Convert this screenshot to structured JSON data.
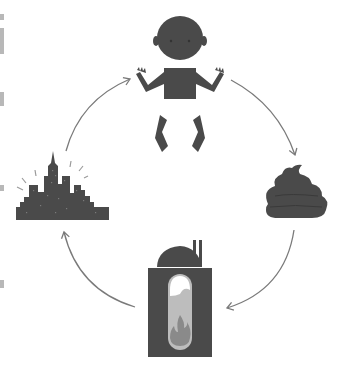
{
  "diagram": {
    "type": "cycle",
    "title": "",
    "colors": {
      "background": "#ffffff",
      "figure": "#4a4a4a",
      "arrow": "#7a7a7a",
      "flame": "#8a8a8a",
      "chamber_light": "#bdbdbd",
      "chamber_top": "#ffffff"
    },
    "nodes": [
      {
        "id": "baby",
        "icon": "baby-icon",
        "position": "top"
      },
      {
        "id": "poop",
        "icon": "poop-icon",
        "position": "right"
      },
      {
        "id": "incinerator",
        "icon": "incinerator-icon",
        "position": "bottom"
      },
      {
        "id": "city",
        "icon": "city-skyline-icon",
        "position": "left"
      }
    ],
    "edges": [
      {
        "from": "baby",
        "to": "poop",
        "direction": "clockwise"
      },
      {
        "from": "poop",
        "to": "incinerator",
        "direction": "clockwise"
      },
      {
        "from": "incinerator",
        "to": "city",
        "direction": "clockwise"
      },
      {
        "from": "city",
        "to": "baby",
        "direction": "clockwise"
      }
    ]
  }
}
